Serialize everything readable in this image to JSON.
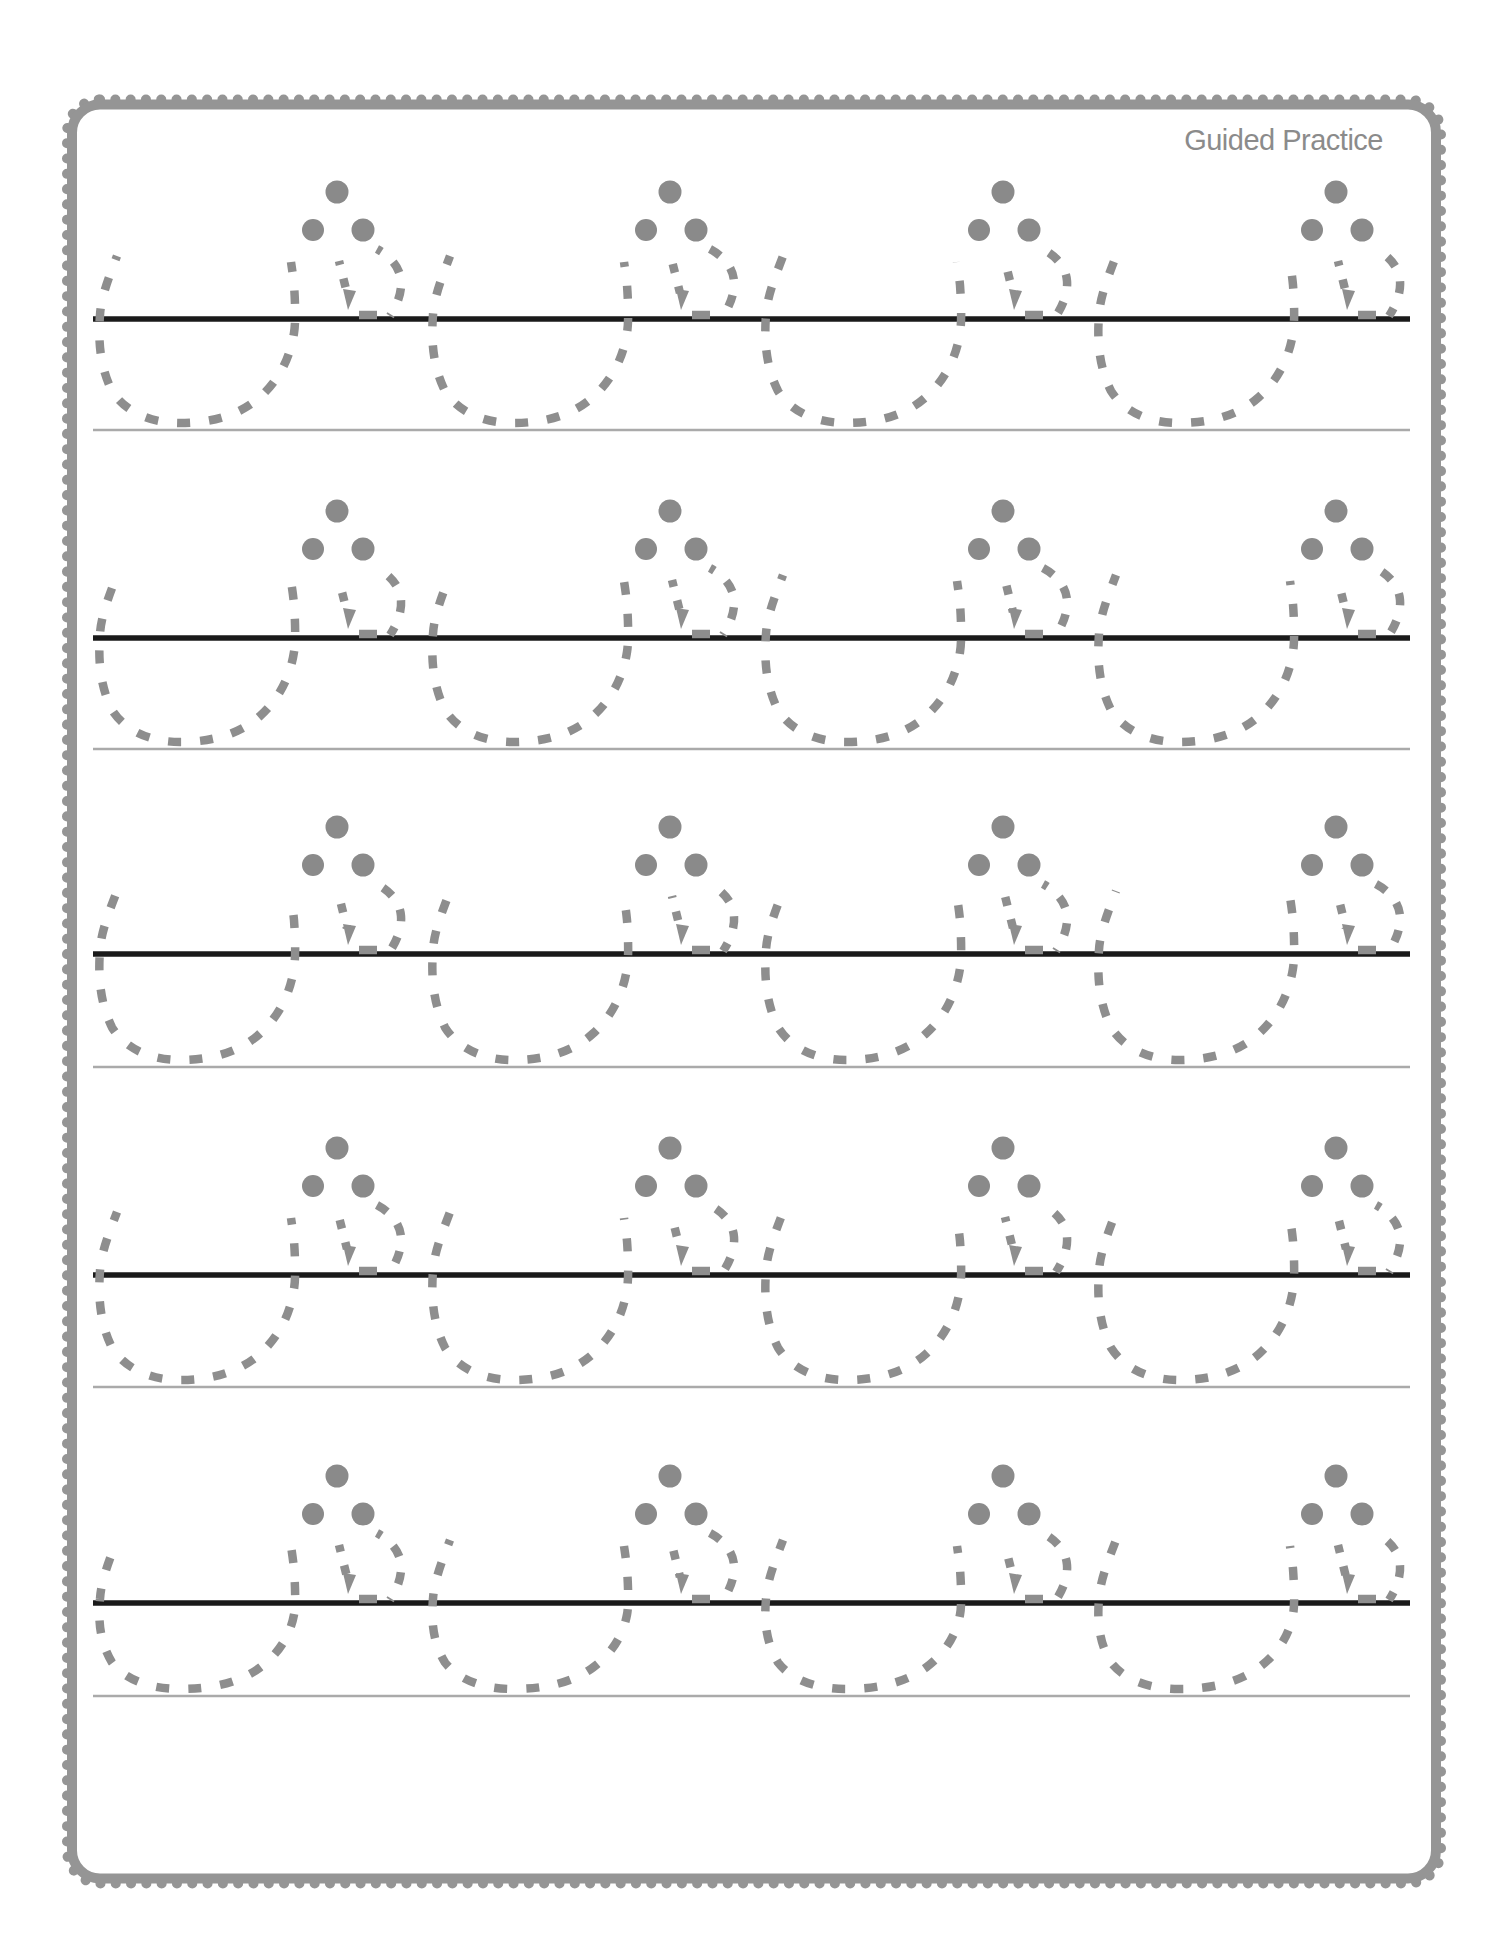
{
  "page": {
    "title": "Guided Practice",
    "width": 1496,
    "height": 1960,
    "background": "#ffffff"
  },
  "colors": {
    "trace": "#8e8e8e",
    "dot": "#8a8a8a",
    "baseline": "#1a1a1a",
    "guideline": "#aaaaaa",
    "border": "#959595",
    "title_text": "#8b8b8b"
  },
  "practice": {
    "rows": [
      {
        "baseline_y": 319,
        "guideline_y": 430
      },
      {
        "baseline_y": 638,
        "guideline_y": 749
      },
      {
        "baseline_y": 954,
        "guideline_y": 1067
      },
      {
        "baseline_y": 1275,
        "guideline_y": 1387
      },
      {
        "baseline_y": 1603,
        "guideline_y": 1696
      }
    ],
    "units_per_row": 4,
    "dots_per_unit": 3,
    "line_start_x": 93,
    "line_end_x": 1410,
    "unit_start_x": 100,
    "unit_spacing": 333
  }
}
